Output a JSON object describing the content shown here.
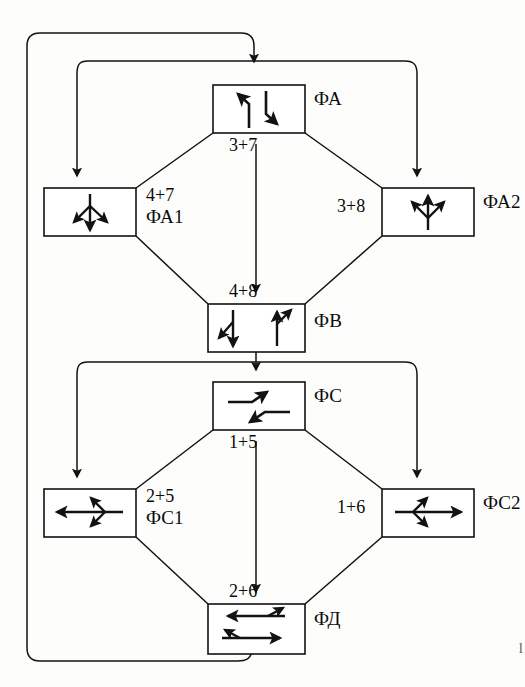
{
  "figure": {
    "type": "traffic-signal-phase-sequence-diagram",
    "title": "",
    "corner_mark": "l"
  },
  "phases": [
    {
      "id": "PhA",
      "label": "ФА",
      "label_pos": "right",
      "box": {
        "x": 213,
        "y": 85,
        "w": 92,
        "h": 48
      },
      "label_x": 314,
      "label_y": 97,
      "icon": "dual-left-turn",
      "movement_code": "3+7",
      "code_x": 240,
      "code_y": 136
    },
    {
      "id": "PhA1",
      "label": "ФА1",
      "label_pos": "right",
      "box": {
        "x": 44,
        "y": 188,
        "w": 92,
        "h": 48
      },
      "label_x": 146,
      "label_y": 212,
      "icon": "south-through-left-right",
      "movement_code": "4+7",
      "code_x": 146,
      "code_y": 188
    },
    {
      "id": "PhA2",
      "label": "ФА2",
      "label_pos": "right",
      "box": {
        "x": 382,
        "y": 188,
        "w": 92,
        "h": 48
      },
      "label_x": 483,
      "label_y": 200,
      "icon": "north-through-left-right",
      "movement_code": "3+8",
      "code_x": 339,
      "code_y": 200
    },
    {
      "id": "PhB",
      "label": "ФВ",
      "label_pos": "right",
      "box": {
        "x": 208,
        "y": 304,
        "w": 97,
        "h": 48
      },
      "label_x": 314,
      "label_y": 316,
      "icon": "dual-through-north-south",
      "movement_code": "4+8",
      "code_x": 238,
      "code_y": 283
    },
    {
      "id": "PhC",
      "label": "ФС",
      "label_pos": "right",
      "box": {
        "x": 213,
        "y": 382,
        "w": 92,
        "h": 48
      },
      "label_x": 314,
      "label_y": 394,
      "icon": "dual-left-turn-horizontal",
      "movement_code": "1+5",
      "code_x": 240,
      "code_y": 433
    },
    {
      "id": "PhC1",
      "label": "ФС1",
      "label_pos": "right",
      "box": {
        "x": 44,
        "y": 489,
        "w": 92,
        "h": 48
      },
      "label_x": 146,
      "label_y": 513,
      "icon": "west-through-left-right",
      "movement_code": "2+5",
      "code_x": 146,
      "code_y": 489
    },
    {
      "id": "PhC2",
      "label": "ФС2",
      "label_pos": "right",
      "box": {
        "x": 382,
        "y": 489,
        "w": 92,
        "h": 48
      },
      "label_x": 483,
      "label_y": 501,
      "icon": "east-through-left-right",
      "movement_code": "1+6",
      "code_x": 339,
      "code_y": 501
    },
    {
      "id": "PhD",
      "label": "ФД",
      "label_pos": "right",
      "box": {
        "x": 208,
        "y": 604,
        "w": 97,
        "h": 50
      },
      "label_x": 314,
      "label_y": 616,
      "icon": "dual-through-east-west",
      "movement_code": "2+6",
      "code_x": 238,
      "code_y": 583
    }
  ],
  "connections": [
    {
      "from": "PhA",
      "to": "PhA1",
      "label": "4+7"
    },
    {
      "from": "PhA",
      "to": "PhA2",
      "label": "3+8"
    },
    {
      "from": "PhA",
      "to": "PhB",
      "label": "3+7"
    },
    {
      "from": "PhA1",
      "to": "PhB",
      "label": "4+8"
    },
    {
      "from": "PhA2",
      "to": "PhB",
      "label": "4+8"
    },
    {
      "from": "PhB",
      "to": "PhC",
      "label": ""
    },
    {
      "from": "PhC",
      "to": "PhC1",
      "label": "2+5"
    },
    {
      "from": "PhC",
      "to": "PhC2",
      "label": "1+6"
    },
    {
      "from": "PhC",
      "to": "PhD",
      "label": "1+5"
    },
    {
      "from": "PhC1",
      "to": "PhD",
      "label": "2+6"
    },
    {
      "from": "PhC2",
      "to": "PhD",
      "label": "2+6"
    },
    {
      "from": "PhD",
      "to": "PhA",
      "label": ""
    }
  ],
  "style": {
    "line_color": "#121212",
    "box_stroke": "#121212",
    "background": "#fdfdfc"
  }
}
